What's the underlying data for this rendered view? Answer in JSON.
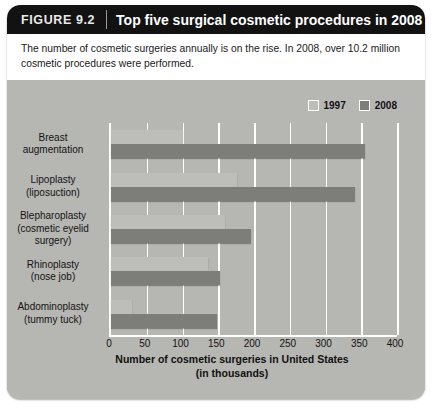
{
  "figure": {
    "number": "FIGURE 9.2",
    "title": "Top five surgical cosmetic procedures in 2008",
    "caption": "The number of cosmetic surgeries annually is on the rise. In 2008, over 10.2 million cosmetic procedures were performed.",
    "edge_credit": ""
  },
  "colors": {
    "header_bg": "#121212",
    "panel_bg": "#b6b6b2",
    "series_1997": "#bdbdb9",
    "series_2008": "#7d7d79",
    "gridline": "#ffffff"
  },
  "chart_data": {
    "type": "bar",
    "orientation": "horizontal",
    "title": "Top five surgical cosmetic procedures in 2008",
    "xlabel": "Number of cosmetic surgeries in United States (in thousands)",
    "xlabel_line1": "Number of cosmetic surgeries in United States",
    "xlabel_line2": "(in thousands)",
    "ylabel": "",
    "xlim": [
      0,
      400
    ],
    "xticks": [
      0,
      50,
      100,
      150,
      200,
      250,
      300,
      350,
      400
    ],
    "grid": true,
    "legend_position": "top-right",
    "categories": [
      "Breast augmentation",
      "Lipoplasty (liposuction)",
      "Blepharoplasty (cosmetic eyelid surgery)",
      "Rhinoplasty (nose job)",
      "Abdominoplasty (tummy tuck)"
    ],
    "category_lines": [
      [
        "Breast",
        "augmentation"
      ],
      [
        "Lipoplasty",
        "(liposuction)"
      ],
      [
        "Blepharoplasty",
        "(cosmetic eyelid",
        "surgery)"
      ],
      [
        "Rhinoplasty",
        "(nose job)"
      ],
      [
        "Abdominoplasty",
        "(tummy tuck)"
      ]
    ],
    "series": [
      {
        "name": "1997",
        "color": "#bdbdb9",
        "values": [
          101,
          176,
          160,
          135,
          30
        ]
      },
      {
        "name": "2008",
        "color": "#7d7d79",
        "values": [
          355,
          341,
          196,
          152,
          148
        ]
      }
    ]
  }
}
